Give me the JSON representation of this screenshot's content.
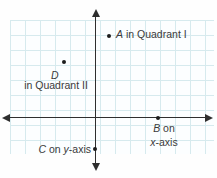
{
  "figure": {
    "colors": {
      "background": "#fefefe",
      "grid_line": "#d6eaee",
      "axis": "#2e2e2e",
      "dot": "#1c1c1c",
      "text": "#3a3a3a"
    },
    "points": {
      "a": {
        "var": "A",
        "rest": " in Quadrant I"
      },
      "d": {
        "var": "D",
        "caption": "in Quadrant II"
      },
      "b": {
        "var": "B",
        "rest": " on",
        "axis_var": "x",
        "axis_rest": "-axis"
      },
      "c": {
        "var": "C",
        "mid": " on ",
        "axis_var": "y",
        "axis_rest": "-axis"
      }
    }
  }
}
